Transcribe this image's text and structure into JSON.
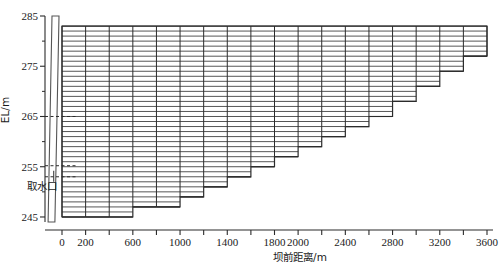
{
  "chart_data": {
    "type": "area",
    "title": "",
    "xlabel": "坝前距离/m",
    "ylabel": "EL/m",
    "xlim": [
      -120,
      3650
    ],
    "ylim": [
      243.5,
      285.5
    ],
    "grid": true,
    "legend": null,
    "x_major_ticks": [
      0,
      200,
      400,
      600,
      800,
      1000,
      1200,
      1400,
      1600,
      1800,
      2000,
      2200,
      2400,
      2600,
      2800,
      3000,
      3200,
      3400,
      3600
    ],
    "x_tick_labels": [
      "0",
      "200",
      "",
      "600",
      "",
      "1000",
      "",
      "1400",
      "",
      "1800",
      "2000",
      "",
      "2400",
      "",
      "2800",
      "",
      "3200",
      "",
      "3600"
    ],
    "y_major_ticks": [
      245,
      255,
      265,
      275,
      285
    ],
    "y_major_tick_labels": [
      "245",
      "255",
      "265",
      "275",
      "285"
    ],
    "y_minor_ticks": [
      250,
      260,
      270,
      280
    ],
    "annotations": [
      {
        "label": "取水口",
        "elevation": 253.0,
        "x": 0,
        "kind": "intake-port"
      },
      {
        "label": "",
        "elevation": 265.0,
        "x": 0,
        "kind": "dashed-level"
      },
      {
        "label": "",
        "elevation": 255.2,
        "x": 0,
        "kind": "dashed-level"
      }
    ],
    "water_surface_elevation": 283.0,
    "layer_thickness_m": 1.0,
    "dam": {
      "crest_elevation": 285.0,
      "base_elevation": 244.0,
      "crest_x_left": -85,
      "crest_x_right": -25,
      "base_x_left": -118,
      "base_x_right": -60
    },
    "bed_profile_note": "Stepped reservoir bed: bed elevation rises with distance from dam",
    "columns": [
      {
        "x_start": 0,
        "x_end": 200,
        "bed_elevation": 245.0
      },
      {
        "x_start": 200,
        "x_end": 400,
        "bed_elevation": 245.0
      },
      {
        "x_start": 400,
        "x_end": 600,
        "bed_elevation": 245.0
      },
      {
        "x_start": 600,
        "x_end": 800,
        "bed_elevation": 247.0
      },
      {
        "x_start": 800,
        "x_end": 1000,
        "bed_elevation": 247.0
      },
      {
        "x_start": 1000,
        "x_end": 1200,
        "bed_elevation": 249.0
      },
      {
        "x_start": 1200,
        "x_end": 1400,
        "bed_elevation": 251.0
      },
      {
        "x_start": 1400,
        "x_end": 1600,
        "bed_elevation": 253.0
      },
      {
        "x_start": 1600,
        "x_end": 1800,
        "bed_elevation": 255.0
      },
      {
        "x_start": 1800,
        "x_end": 2000,
        "bed_elevation": 257.0
      },
      {
        "x_start": 2000,
        "x_end": 2200,
        "bed_elevation": 259.0
      },
      {
        "x_start": 2200,
        "x_end": 2400,
        "bed_elevation": 261.0
      },
      {
        "x_start": 2400,
        "x_end": 2600,
        "bed_elevation": 263.0
      },
      {
        "x_start": 2600,
        "x_end": 2800,
        "bed_elevation": 265.0
      },
      {
        "x_start": 2800,
        "x_end": 3000,
        "bed_elevation": 268.0
      },
      {
        "x_start": 3000,
        "x_end": 3200,
        "bed_elevation": 271.0
      },
      {
        "x_start": 3200,
        "x_end": 3400,
        "bed_elevation": 274.0
      },
      {
        "x_start": 3400,
        "x_end": 3600,
        "bed_elevation": 277.0
      }
    ]
  },
  "axes": {
    "y_title": "EL/m",
    "x_title": "坝前距离/m"
  },
  "labels": {
    "intake": "取水口"
  }
}
